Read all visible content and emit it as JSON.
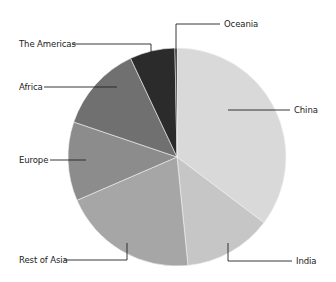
{
  "chart_data": {
    "type": "pie",
    "title": "",
    "start_angle_deg": 0,
    "direction": "clockwise",
    "center": [
      177,
      157
    ],
    "radius": 109,
    "slices": [
      {
        "label": "China",
        "value": 35.3,
        "color": "#d9d9d9"
      },
      {
        "label": "India",
        "value": 13.1,
        "color": "#c6c6c6"
      },
      {
        "label": "Rest of Asia",
        "value": 20.1,
        "color": "#a6a6a6"
      },
      {
        "label": "Europe",
        "value": 11.7,
        "color": "#8c8c8c"
      },
      {
        "label": "Africa",
        "value": 12.8,
        "color": "#707070"
      },
      {
        "label": "The Americas",
        "value": 6.7,
        "color": "#2b2b2b"
      },
      {
        "label": "Oceania",
        "value": 0.3,
        "color": "#111111"
      }
    ],
    "labels_layout": [
      {
        "label": "Oceania",
        "text_pos": [
          224,
          19
        ],
        "line": [
          [
            176,
            48
          ],
          [
            176,
            24
          ],
          [
            220,
            24
          ]
        ]
      },
      {
        "label": "The Americas",
        "text_pos": [
          19,
          39
        ],
        "line": [
          [
            72,
            44
          ],
          [
            151,
            44
          ],
          [
            151,
            53
          ]
        ]
      },
      {
        "label": "Africa",
        "text_pos": [
          19,
          82
        ],
        "line": [
          [
            44,
            87
          ],
          [
            117,
            87
          ]
        ]
      },
      {
        "label": "China",
        "text_pos": [
          294,
          105
        ],
        "line": [
          [
            228,
            110
          ],
          [
            290,
            110
          ]
        ]
      },
      {
        "label": "Europe",
        "text_pos": [
          19,
          155
        ],
        "line": [
          [
            50,
            160
          ],
          [
            86,
            160
          ]
        ]
      },
      {
        "label": "Rest of Asia",
        "text_pos": [
          19,
          255
        ],
        "line": [
          [
            64,
            260
          ],
          [
            127,
            260
          ],
          [
            127,
            243
          ]
        ]
      },
      {
        "label": "India",
        "text_pos": [
          296,
          256
        ],
        "line": [
          [
            228,
            243
          ],
          [
            228,
            261
          ],
          [
            292,
            261
          ]
        ]
      }
    ],
    "legend": null,
    "grid": false
  }
}
